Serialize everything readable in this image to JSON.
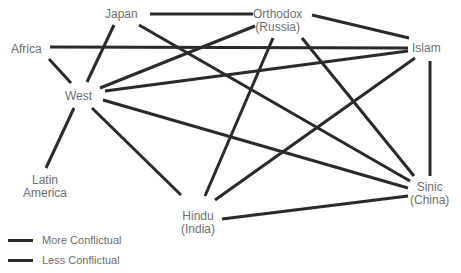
{
  "diagram": {
    "type": "network",
    "nodes": [
      {
        "id": "japan",
        "label": "Japan",
        "lines": [
          "Japan"
        ],
        "x": 105,
        "y": 8
      },
      {
        "id": "orthodox",
        "label": "Orthodox (Russia)",
        "lines": [
          "Orthodox",
          "(Russia)"
        ],
        "x": 253,
        "y": 8
      },
      {
        "id": "islam",
        "label": "Islam",
        "lines": [
          "Islam"
        ],
        "x": 412,
        "y": 42
      },
      {
        "id": "africa",
        "label": "Africa",
        "lines": [
          "Africa"
        ],
        "x": 11,
        "y": 43
      },
      {
        "id": "west",
        "label": "West",
        "lines": [
          "West"
        ],
        "x": 65,
        "y": 90
      },
      {
        "id": "latin_america",
        "label": "Latin America",
        "lines": [
          "Latin",
          "America"
        ],
        "x": 23,
        "y": 174
      },
      {
        "id": "hindu",
        "label": "Hindu (India)",
        "lines": [
          "Hindu",
          "(India)"
        ],
        "x": 181,
        "y": 210
      },
      {
        "id": "sinic",
        "label": "Sinic (China)",
        "lines": [
          "Sinic",
          "(China)"
        ],
        "x": 410,
        "y": 181
      }
    ],
    "edges": [
      {
        "from": "japan",
        "to": "orthodox",
        "x1": 150,
        "y1": 14,
        "x2": 253,
        "y2": 14
      },
      {
        "from": "japan",
        "to": "west",
        "x1": 114,
        "y1": 25,
        "x2": 87,
        "y2": 82
      },
      {
        "from": "japan",
        "to": "sinic",
        "x1": 139,
        "y1": 25,
        "x2": 410,
        "y2": 181
      },
      {
        "from": "orthodox",
        "to": "islam",
        "x1": 312,
        "y1": 15,
        "x2": 409,
        "y2": 38
      },
      {
        "from": "orthodox",
        "to": "west",
        "x1": 255,
        "y1": 26,
        "x2": 100,
        "y2": 88
      },
      {
        "from": "orthodox",
        "to": "hindu",
        "x1": 273,
        "y1": 38,
        "x2": 205,
        "y2": 196
      },
      {
        "from": "orthodox",
        "to": "sinic",
        "x1": 302,
        "y1": 38,
        "x2": 414,
        "y2": 176
      },
      {
        "from": "africa",
        "to": "islam",
        "x1": 50,
        "y1": 47,
        "x2": 408,
        "y2": 48
      },
      {
        "from": "africa",
        "to": "west",
        "x1": 49,
        "y1": 59,
        "x2": 71,
        "y2": 83
      },
      {
        "from": "west",
        "to": "islam",
        "x1": 105,
        "y1": 91,
        "x2": 408,
        "y2": 51
      },
      {
        "from": "west",
        "to": "sinic",
        "x1": 103,
        "y1": 100,
        "x2": 408,
        "y2": 188
      },
      {
        "from": "west",
        "to": "latin_america",
        "x1": 74,
        "y1": 108,
        "x2": 46,
        "y2": 168
      },
      {
        "from": "west",
        "to": "hindu",
        "x1": 92,
        "y1": 108,
        "x2": 181,
        "y2": 195
      },
      {
        "from": "islam",
        "to": "hindu",
        "x1": 415,
        "y1": 58,
        "x2": 215,
        "y2": 200
      },
      {
        "from": "islam",
        "to": "sinic",
        "x1": 430,
        "y1": 61,
        "x2": 430,
        "y2": 176
      },
      {
        "from": "hindu",
        "to": "sinic",
        "x1": 222,
        "y1": 219,
        "x2": 408,
        "y2": 196
      }
    ],
    "edge_color": "#2a2a2a",
    "label_color": "#6e6e6e"
  },
  "legend": {
    "items": [
      {
        "label": "More Conflictual"
      },
      {
        "label": "Less Conflictual"
      }
    ]
  }
}
